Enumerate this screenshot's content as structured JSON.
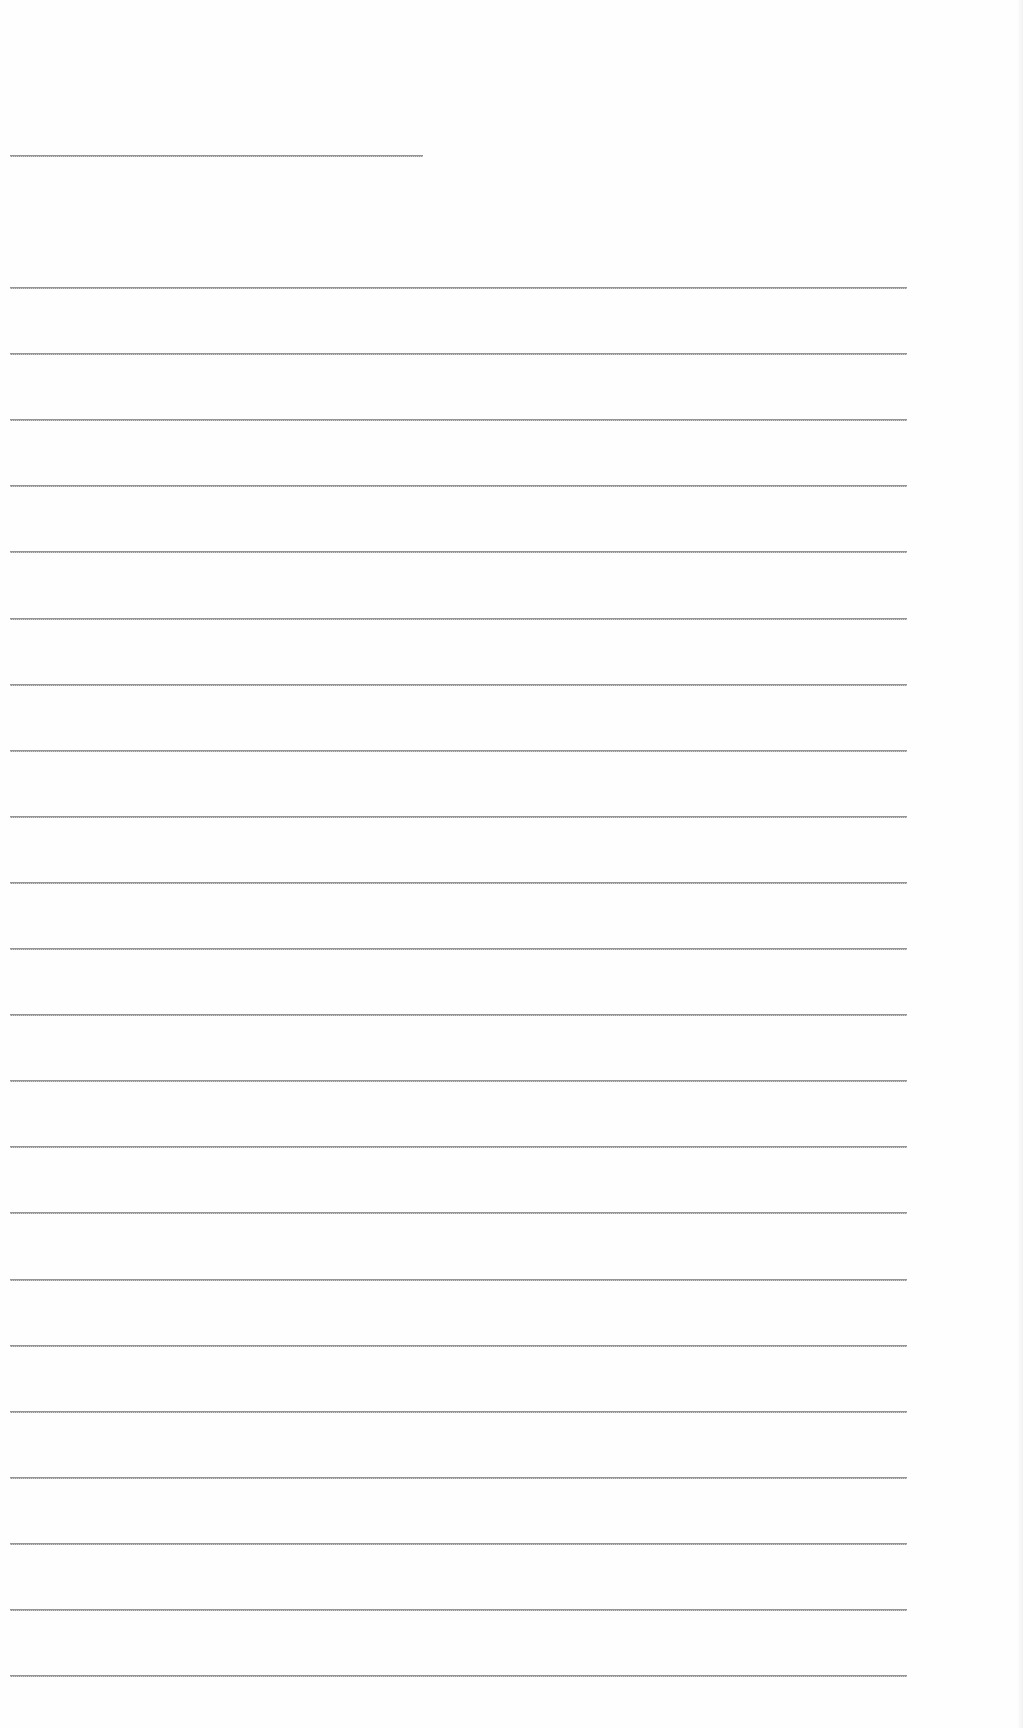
{
  "document": {
    "type": "blank lined page",
    "background_color": "#fefefe",
    "line_color": "#8a8a8a",
    "header_line": {
      "y": 155,
      "x_start": 10,
      "x_end": 423
    },
    "ruled_lines": {
      "count": 22,
      "first_y": 287,
      "spacing": 66.1,
      "x_start": 10,
      "x_end": 907
    }
  }
}
